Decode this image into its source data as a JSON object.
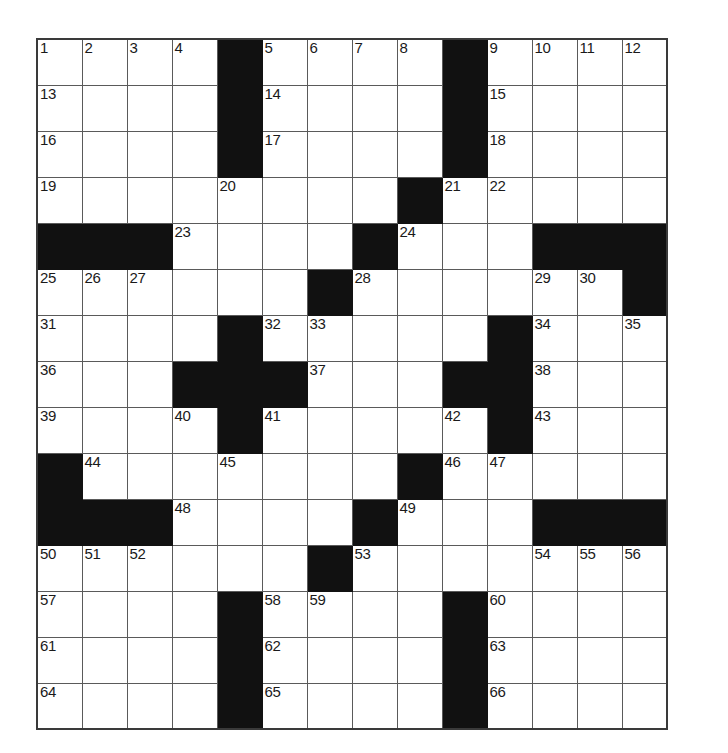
{
  "puzzle": {
    "kind": "crossword-grid",
    "rows": 14,
    "columns": 14,
    "cell_size_px": 46,
    "colors": {
      "background": "#ffffff",
      "block": "#111111",
      "grid_line": "#5a5a5a",
      "border": "#3a3a3a",
      "number_text": "#1a1a1a"
    },
    "highest_clue_number": 66,
    "grid": [
      [
        {
          "type": "white",
          "number": "1"
        },
        {
          "type": "white",
          "number": "2"
        },
        {
          "type": "white",
          "number": "3"
        },
        {
          "type": "white",
          "number": "4"
        },
        {
          "type": "block",
          "number": ""
        },
        {
          "type": "white",
          "number": "5"
        },
        {
          "type": "white",
          "number": "6"
        },
        {
          "type": "white",
          "number": "7"
        },
        {
          "type": "white",
          "number": "8"
        },
        {
          "type": "block",
          "number": ""
        },
        {
          "type": "white",
          "number": "9"
        },
        {
          "type": "white",
          "number": "10"
        },
        {
          "type": "white",
          "number": "11"
        },
        {
          "type": "white",
          "number": "12"
        }
      ],
      [
        {
          "type": "white",
          "number": "13"
        },
        {
          "type": "white",
          "number": ""
        },
        {
          "type": "white",
          "number": ""
        },
        {
          "type": "white",
          "number": ""
        },
        {
          "type": "block",
          "number": ""
        },
        {
          "type": "white",
          "number": "14"
        },
        {
          "type": "white",
          "number": ""
        },
        {
          "type": "white",
          "number": ""
        },
        {
          "type": "white",
          "number": ""
        },
        {
          "type": "block",
          "number": ""
        },
        {
          "type": "white",
          "number": "15"
        },
        {
          "type": "white",
          "number": ""
        },
        {
          "type": "white",
          "number": ""
        },
        {
          "type": "white",
          "number": ""
        }
      ],
      [
        {
          "type": "white",
          "number": "16"
        },
        {
          "type": "white",
          "number": ""
        },
        {
          "type": "white",
          "number": ""
        },
        {
          "type": "white",
          "number": ""
        },
        {
          "type": "block",
          "number": ""
        },
        {
          "type": "white",
          "number": "17"
        },
        {
          "type": "white",
          "number": ""
        },
        {
          "type": "white",
          "number": ""
        },
        {
          "type": "white",
          "number": ""
        },
        {
          "type": "block",
          "number": ""
        },
        {
          "type": "white",
          "number": "18"
        },
        {
          "type": "white",
          "number": ""
        },
        {
          "type": "white",
          "number": ""
        },
        {
          "type": "white",
          "number": ""
        }
      ],
      [
        {
          "type": "white",
          "number": "19"
        },
        {
          "type": "white",
          "number": ""
        },
        {
          "type": "white",
          "number": ""
        },
        {
          "type": "white",
          "number": ""
        },
        {
          "type": "white",
          "number": "20"
        },
        {
          "type": "white",
          "number": ""
        },
        {
          "type": "white",
          "number": ""
        },
        {
          "type": "white",
          "number": ""
        },
        {
          "type": "block",
          "number": ""
        },
        {
          "type": "white",
          "number": "21"
        },
        {
          "type": "white",
          "number": "22"
        },
        {
          "type": "white",
          "number": ""
        },
        {
          "type": "white",
          "number": ""
        },
        {
          "type": "white",
          "number": ""
        }
      ],
      [
        {
          "type": "block",
          "number": ""
        },
        {
          "type": "block",
          "number": ""
        },
        {
          "type": "block",
          "number": ""
        },
        {
          "type": "white",
          "number": "23"
        },
        {
          "type": "white",
          "number": ""
        },
        {
          "type": "white",
          "number": ""
        },
        {
          "type": "white",
          "number": ""
        },
        {
          "type": "block",
          "number": ""
        },
        {
          "type": "white",
          "number": "24"
        },
        {
          "type": "white",
          "number": ""
        },
        {
          "type": "white",
          "number": ""
        },
        {
          "type": "block",
          "number": ""
        },
        {
          "type": "block",
          "number": ""
        },
        {
          "type": "block",
          "number": ""
        }
      ],
      [
        {
          "type": "white",
          "number": "25"
        },
        {
          "type": "white",
          "number": "26"
        },
        {
          "type": "white",
          "number": "27"
        },
        {
          "type": "white",
          "number": ""
        },
        {
          "type": "white",
          "number": ""
        },
        {
          "type": "white",
          "number": ""
        },
        {
          "type": "block",
          "number": ""
        },
        {
          "type": "white",
          "number": "28"
        },
        {
          "type": "white",
          "number": ""
        },
        {
          "type": "white",
          "number": ""
        },
        {
          "type": "white",
          "number": ""
        },
        {
          "type": "white",
          "number": "29"
        },
        {
          "type": "white",
          "number": "30"
        },
        {
          "type": "block",
          "number": ""
        }
      ],
      [
        {
          "type": "white",
          "number": "31"
        },
        {
          "type": "white",
          "number": ""
        },
        {
          "type": "white",
          "number": ""
        },
        {
          "type": "white",
          "number": ""
        },
        {
          "type": "block",
          "number": ""
        },
        {
          "type": "white",
          "number": "32"
        },
        {
          "type": "white",
          "number": "33"
        },
        {
          "type": "white",
          "number": ""
        },
        {
          "type": "white",
          "number": ""
        },
        {
          "type": "white",
          "number": ""
        },
        {
          "type": "block",
          "number": ""
        },
        {
          "type": "white",
          "number": "34"
        },
        {
          "type": "white",
          "number": ""
        },
        {
          "type": "white",
          "number": "35"
        }
      ],
      [
        {
          "type": "white",
          "number": "36"
        },
        {
          "type": "white",
          "number": ""
        },
        {
          "type": "white",
          "number": ""
        },
        {
          "type": "block",
          "number": ""
        },
        {
          "type": "block",
          "number": ""
        },
        {
          "type": "block",
          "number": ""
        },
        {
          "type": "white",
          "number": "37"
        },
        {
          "type": "white",
          "number": ""
        },
        {
          "type": "white",
          "number": ""
        },
        {
          "type": "block",
          "number": ""
        },
        {
          "type": "block",
          "number": ""
        },
        {
          "type": "white",
          "number": "38"
        },
        {
          "type": "white",
          "number": ""
        },
        {
          "type": "white",
          "number": ""
        }
      ],
      [
        {
          "type": "white",
          "number": "39"
        },
        {
          "type": "white",
          "number": ""
        },
        {
          "type": "white",
          "number": ""
        },
        {
          "type": "white",
          "number": "40"
        },
        {
          "type": "block",
          "number": ""
        },
        {
          "type": "white",
          "number": "41"
        },
        {
          "type": "white",
          "number": ""
        },
        {
          "type": "white",
          "number": ""
        },
        {
          "type": "white",
          "number": ""
        },
        {
          "type": "white",
          "number": "42"
        },
        {
          "type": "block",
          "number": ""
        },
        {
          "type": "white",
          "number": "43"
        },
        {
          "type": "white",
          "number": ""
        },
        {
          "type": "white",
          "number": ""
        }
      ],
      [
        {
          "type": "block",
          "number": ""
        },
        {
          "type": "white",
          "number": "44"
        },
        {
          "type": "white",
          "number": ""
        },
        {
          "type": "white",
          "number": ""
        },
        {
          "type": "white",
          "number": "45"
        },
        {
          "type": "white",
          "number": ""
        },
        {
          "type": "white",
          "number": ""
        },
        {
          "type": "white",
          "number": ""
        },
        {
          "type": "block",
          "number": ""
        },
        {
          "type": "white",
          "number": "46"
        },
        {
          "type": "white",
          "number": "47"
        },
        {
          "type": "white",
          "number": ""
        },
        {
          "type": "white",
          "number": ""
        },
        {
          "type": "white",
          "number": ""
        }
      ],
      [
        {
          "type": "block",
          "number": ""
        },
        {
          "type": "block",
          "number": ""
        },
        {
          "type": "block",
          "number": ""
        },
        {
          "type": "white",
          "number": "48"
        },
        {
          "type": "white",
          "number": ""
        },
        {
          "type": "white",
          "number": ""
        },
        {
          "type": "white",
          "number": ""
        },
        {
          "type": "block",
          "number": ""
        },
        {
          "type": "white",
          "number": "49"
        },
        {
          "type": "white",
          "number": ""
        },
        {
          "type": "white",
          "number": ""
        },
        {
          "type": "block",
          "number": ""
        },
        {
          "type": "block",
          "number": ""
        },
        {
          "type": "block",
          "number": ""
        }
      ],
      [
        {
          "type": "white",
          "number": "50"
        },
        {
          "type": "white",
          "number": "51"
        },
        {
          "type": "white",
          "number": "52"
        },
        {
          "type": "white",
          "number": ""
        },
        {
          "type": "white",
          "number": ""
        },
        {
          "type": "white",
          "number": ""
        },
        {
          "type": "block",
          "number": ""
        },
        {
          "type": "white",
          "number": "53"
        },
        {
          "type": "white",
          "number": ""
        },
        {
          "type": "white",
          "number": ""
        },
        {
          "type": "white",
          "number": ""
        },
        {
          "type": "white",
          "number": "54"
        },
        {
          "type": "white",
          "number": "55"
        },
        {
          "type": "white",
          "number": "56"
        }
      ],
      [
        {
          "type": "white",
          "number": "57"
        },
        {
          "type": "white",
          "number": ""
        },
        {
          "type": "white",
          "number": ""
        },
        {
          "type": "white",
          "number": ""
        },
        {
          "type": "block",
          "number": ""
        },
        {
          "type": "white",
          "number": "58"
        },
        {
          "type": "white",
          "number": "59"
        },
        {
          "type": "white",
          "number": ""
        },
        {
          "type": "white",
          "number": ""
        },
        {
          "type": "block",
          "number": ""
        },
        {
          "type": "white",
          "number": "60"
        },
        {
          "type": "white",
          "number": ""
        },
        {
          "type": "white",
          "number": ""
        },
        {
          "type": "white",
          "number": ""
        }
      ],
      [
        {
          "type": "white",
          "number": "61"
        },
        {
          "type": "white",
          "number": ""
        },
        {
          "type": "white",
          "number": ""
        },
        {
          "type": "white",
          "number": ""
        },
        {
          "type": "block",
          "number": ""
        },
        {
          "type": "white",
          "number": "62"
        },
        {
          "type": "white",
          "number": ""
        },
        {
          "type": "white",
          "number": ""
        },
        {
          "type": "white",
          "number": ""
        },
        {
          "type": "block",
          "number": ""
        },
        {
          "type": "white",
          "number": "63"
        },
        {
          "type": "white",
          "number": ""
        },
        {
          "type": "white",
          "number": ""
        },
        {
          "type": "white",
          "number": ""
        }
      ],
      [
        {
          "type": "white",
          "number": "64"
        },
        {
          "type": "white",
          "number": ""
        },
        {
          "type": "white",
          "number": ""
        },
        {
          "type": "white",
          "number": ""
        },
        {
          "type": "block",
          "number": ""
        },
        {
          "type": "white",
          "number": "65"
        },
        {
          "type": "white",
          "number": ""
        },
        {
          "type": "white",
          "number": ""
        },
        {
          "type": "white",
          "number": ""
        },
        {
          "type": "block",
          "number": ""
        },
        {
          "type": "white",
          "number": "66"
        },
        {
          "type": "white",
          "number": ""
        },
        {
          "type": "white",
          "number": ""
        },
        {
          "type": "white",
          "number": ""
        }
      ]
    ]
  }
}
